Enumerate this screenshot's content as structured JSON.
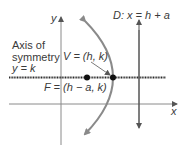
{
  "diagram": {
    "labels": {
      "y_axis": "y",
      "x_axis": "x",
      "directrix": "D: x = h + a",
      "axis_sym_line1": "Axis of",
      "axis_sym_line2": "symmetry",
      "axis_sym_line3": "y = k",
      "vertex": "V = (h, k)",
      "focus": "F = (h − a, k)"
    },
    "colors": {
      "axes": "#8a8a8a",
      "parabola": "#8a8a8a",
      "symmetry_line": "#2a2a2a",
      "points": "#111111",
      "text": "#3a3a3a"
    }
  }
}
